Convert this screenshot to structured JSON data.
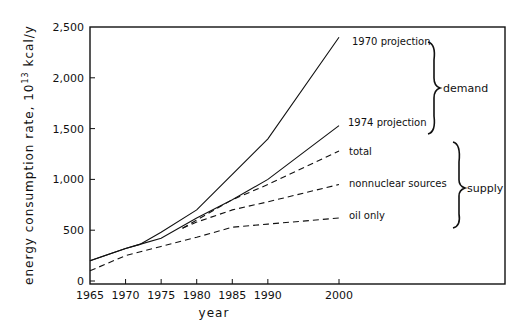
{
  "chart_data": {
    "type": "line",
    "title": "",
    "xlabel": "year",
    "ylabel": "energy consumption rate, 10^13 kcal/y",
    "ylabel_parts": {
      "main": "energy consumption rate, 10",
      "sup": "13",
      "unit": " kcal/y"
    },
    "xlim": [
      1965,
      2000
    ],
    "ylim": [
      0,
      2500
    ],
    "x_ticks": [
      1965,
      1970,
      1975,
      1980,
      1985,
      1990,
      2000
    ],
    "x_tick_labels": [
      "1965",
      "1970",
      "1975",
      "1980",
      "1985",
      "1990",
      "2000"
    ],
    "y_ticks": [
      0,
      500,
      1000,
      1500,
      2000,
      2500
    ],
    "y_tick_labels": [
      "0",
      "500",
      "1,000",
      "1,500",
      "2,000",
      "2,500"
    ],
    "grid": false,
    "legend_position": "inline labels at right end of lines",
    "series": [
      {
        "name": "1970 projection",
        "group": "demand",
        "style": "solid",
        "x": [
          1965,
          1970,
          1972,
          1975,
          1980,
          1985,
          1990,
          2000
        ],
        "values": [
          200,
          320,
          360,
          480,
          700,
          1050,
          1400,
          2400
        ]
      },
      {
        "name": "1974 projection",
        "group": "demand",
        "style": "solid",
        "x": [
          1965,
          1970,
          1972,
          1975,
          1980,
          1985,
          1990,
          2000
        ],
        "values": [
          200,
          320,
          360,
          420,
          620,
          800,
          1000,
          1530
        ]
      },
      {
        "name": "total",
        "group": "supply",
        "style": "dashed",
        "x": [
          1978,
          1980,
          1985,
          1990,
          2000
        ],
        "values": [
          520,
          600,
          800,
          950,
          1280
        ]
      },
      {
        "name": "nonnuclear sources",
        "group": "supply",
        "style": "dashed",
        "x": [
          1978,
          1980,
          1985,
          1990,
          2000
        ],
        "values": [
          520,
          580,
          700,
          780,
          950
        ]
      },
      {
        "name": "oil only",
        "group": "supply",
        "style": "dashed",
        "x": [
          1965,
          1970,
          1975,
          1980,
          1985,
          1990,
          2000
        ],
        "values": [
          100,
          250,
          340,
          430,
          530,
          560,
          620
        ]
      }
    ],
    "annotations": [
      {
        "text": "demand",
        "brace_spans": [
          "1970 projection",
          "1974 projection"
        ]
      },
      {
        "text": "supply",
        "brace_spans": [
          "total",
          "nonnuclear sources",
          "oil only"
        ]
      }
    ]
  }
}
